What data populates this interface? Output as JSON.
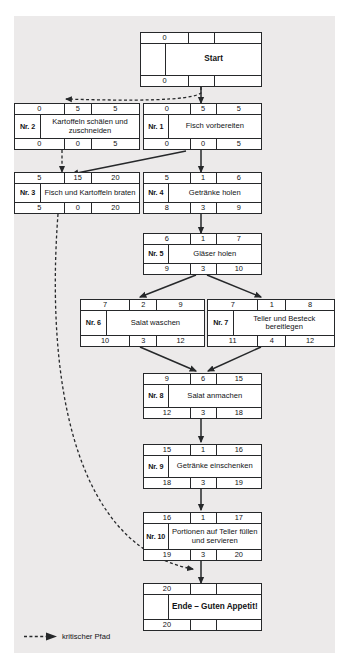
{
  "diagram": {
    "type": "network-plan",
    "title_visible": false,
    "legend": {
      "label": "kritischer Pfad",
      "marker": "dashed-arrow-icon"
    },
    "column_headers_hidden": [
      "FAZ",
      "D",
      "FEZ",
      "Nr.",
      "Vorgang",
      "SAZ",
      "GP",
      "SEZ"
    ]
  },
  "nodes": [
    {
      "id": "start",
      "nr": "",
      "title": "Start",
      "top": [
        "0",
        "",
        ""
      ],
      "bottom": [
        "0",
        "",
        ""
      ],
      "terminal": true
    },
    {
      "id": "n2",
      "nr": "Nr. 2",
      "title": "Kartoffeln schälen und zuschneiden",
      "top": [
        "0",
        "5",
        "5"
      ],
      "bottom": [
        "0",
        "0",
        "5"
      ],
      "terminal": false
    },
    {
      "id": "n1",
      "nr": "Nr. 1",
      "title": "Fisch vorbereiten",
      "top": [
        "0",
        "5",
        "5"
      ],
      "bottom": [
        "0",
        "0",
        "5"
      ],
      "terminal": false
    },
    {
      "id": "n3",
      "nr": "Nr. 3",
      "title": "Fisch und Kartoffeln braten",
      "top": [
        "5",
        "15",
        "20"
      ],
      "bottom": [
        "5",
        "0",
        "20"
      ],
      "terminal": false
    },
    {
      "id": "n4",
      "nr": "Nr. 4",
      "title": "Getränke holen",
      "top": [
        "5",
        "1",
        "6"
      ],
      "bottom": [
        "8",
        "3",
        "9"
      ],
      "terminal": false
    },
    {
      "id": "n5",
      "nr": "Nr. 5",
      "title": "Gläser holen",
      "top": [
        "6",
        "1",
        "7"
      ],
      "bottom": [
        "9",
        "3",
        "10"
      ],
      "terminal": false
    },
    {
      "id": "n6",
      "nr": "Nr. 6",
      "title": "Salat waschen",
      "top": [
        "7",
        "2",
        "9"
      ],
      "bottom": [
        "10",
        "3",
        "12"
      ],
      "terminal": false
    },
    {
      "id": "n7",
      "nr": "Nr. 7",
      "title": "Teller und Besteck bereitlegen",
      "top": [
        "7",
        "1",
        "8"
      ],
      "bottom": [
        "11",
        "4",
        "12"
      ],
      "terminal": false
    },
    {
      "id": "n8",
      "nr": "Nr. 8",
      "title": "Salat anmachen",
      "top": [
        "9",
        "6",
        "15"
      ],
      "bottom": [
        "12",
        "3",
        "18"
      ],
      "terminal": false
    },
    {
      "id": "n9",
      "nr": "Nr. 9",
      "title": "Getränke einschenken",
      "top": [
        "15",
        "1",
        "16"
      ],
      "bottom": [
        "18",
        "3",
        "19"
      ],
      "terminal": false
    },
    {
      "id": "n10",
      "nr": "Nr. 10",
      "title": "Portionen auf Teller füllen und servieren",
      "top": [
        "16",
        "1",
        "17"
      ],
      "bottom": [
        "19",
        "3",
        "20"
      ],
      "terminal": false
    },
    {
      "id": "end",
      "nr": "",
      "title": "Ende – Guten Appetit!",
      "top": [
        "20",
        "",
        ""
      ],
      "bottom": [
        "20",
        "",
        ""
      ],
      "terminal": true
    }
  ],
  "colors": {
    "plate": "#eceaea",
    "line": "#26282a",
    "node_fill": "#ffffff",
    "text": "#111315"
  }
}
